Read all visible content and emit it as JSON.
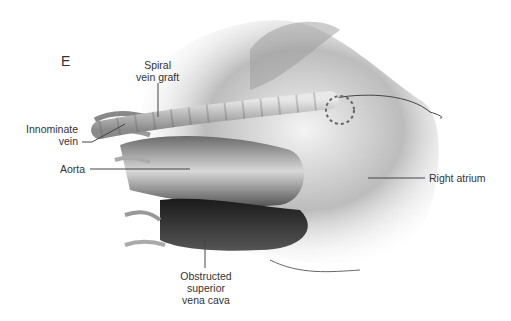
{
  "figure": {
    "panel_letter": "E",
    "labels": {
      "spiral_vein_graft": [
        "Spiral",
        "vein graft"
      ],
      "innominate_vein": [
        "Innominate",
        "vein"
      ],
      "aorta": "Aorta",
      "right_atrium": "Right atrium",
      "obstructed_svc": [
        "Obstructed",
        "superior",
        "vena cava"
      ]
    }
  }
}
